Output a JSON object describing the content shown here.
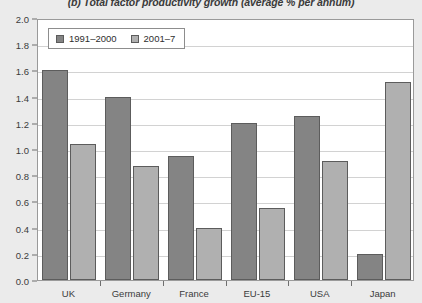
{
  "chart_data": {
    "type": "bar",
    "title": "(b) Total factor productivity growth (average % per annum)",
    "xlabel": "",
    "ylabel": "",
    "categories": [
      "UK",
      "Germany",
      "France",
      "EU-15",
      "USA",
      "Japan"
    ],
    "series": [
      {
        "name": "1991–2000",
        "color": "#848484",
        "values": [
          1.6,
          1.4,
          0.95,
          1.2,
          1.25,
          0.2
        ]
      },
      {
        "name": "2001–7",
        "color": "#b0b0b0",
        "values": [
          1.04,
          0.87,
          0.4,
          0.55,
          0.91,
          1.51
        ]
      }
    ],
    "ylim": [
      0.0,
      2.0
    ],
    "ytick_labels": [
      "0.0",
      "0.2",
      "0.4",
      "0.6",
      "0.8",
      "1.0",
      "1.2",
      "1.4",
      "1.6",
      "1.8",
      "2.0"
    ],
    "ytick_values": [
      0.0,
      0.2,
      0.4,
      0.6,
      0.8,
      1.0,
      1.2,
      1.4,
      1.6,
      1.8,
      2.0
    ],
    "grid": true,
    "legend_position": "top-left"
  },
  "colors": {
    "background": "#ebebeb",
    "plot_background": "#ffffff",
    "axis": "#9a9a9a",
    "gridline": "#d2d2d2",
    "text": "#3b3b3b",
    "bar_edge": "#5c5c5c"
  }
}
